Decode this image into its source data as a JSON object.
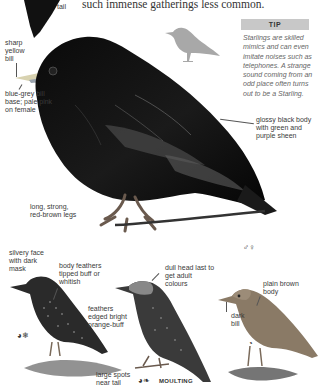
{
  "intro_text_fragment": "such immense gatherings less common.",
  "tail_label": "tail",
  "tip": {
    "heading": "TIP",
    "body": "Starlings are skilled mimics and can even imitate noises such as telephones. A strange sound coming from an odd place often turns out to be a Starling."
  },
  "main_bird_labels": {
    "bill": "sharp yellow bill",
    "bill_base": "blue-grey bill base; pale pink on female",
    "body": "glossy black body with green and purple sheen",
    "legs": "long, strong, red-brown legs"
  },
  "main_bird_symbols": [
    "♂",
    "♀"
  ],
  "winter_bird_labels": {
    "face": "silvery face with dark mask",
    "body": "body feathers tipped buff or whitish",
    "feathers": "feathers edged bright orange-buff",
    "spots": "large spots near tail"
  },
  "winter_bird_symbols": [
    "season-icon",
    "winter-icon"
  ],
  "moulting_bird_labels": {
    "head": "dull head last to get adult colours",
    "caption": "MOULTING"
  },
  "juvenile_bird_labels": {
    "body": "plain brown body",
    "bill": "dark bill"
  },
  "colors": {
    "tip_header_bg": "#c8c8c8",
    "silhouette": "#a8a8a8",
    "juvenile_body": "#8a7a66"
  }
}
